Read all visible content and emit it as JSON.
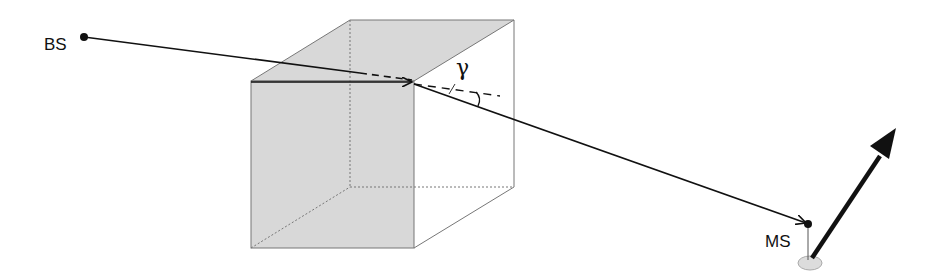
{
  "diagram": {
    "type": "geometry-illustration",
    "labels": {
      "base_station": "BS",
      "mobile_station": "MS",
      "angle": "γ"
    },
    "elements": {
      "building": "shaded-cube",
      "incident_ray": "BS to building edge",
      "diffracted_ray": "building edge to MS",
      "extension": "dashed continuation of incident ray",
      "movement_arrow": "thick arrow from MS"
    },
    "colors": {
      "face_fill": "#d8d8d8",
      "edge": "#777777",
      "ray": "#111111",
      "ground_ellipse": "#dcdcdc"
    }
  }
}
